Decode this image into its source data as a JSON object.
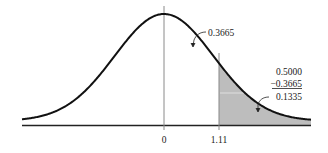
{
  "chart_data": {
    "type": "area",
    "title": "",
    "xlabel": "",
    "ylabel": "",
    "tick_labels": [
      "0",
      "1.11"
    ],
    "x_ticks": [
      0,
      1.11
    ],
    "xlim": [
      -3,
      3
    ],
    "grid": false,
    "legend": null,
    "shaded_region": {
      "from": 1.11,
      "to": "inf"
    },
    "annotations": [
      {
        "text": "0.3665",
        "points_to": "area between 0 and 1.11"
      },
      {
        "lines": [
          "0.5000",
          "−0.3665",
          "0.1335"
        ],
        "points_to": "shaded tail area right of 1.11"
      }
    ],
    "values": {
      "area_0_to_z": 0.3665,
      "half_area": 0.5,
      "tail_area": 0.1335,
      "z": 1.11
    }
  },
  "labels": {
    "zero": "0",
    "z": "1.11",
    "area_center": "0.3665",
    "calc_line1": "0.5000",
    "calc_line2": "−0.3665",
    "calc_line3": "0.1335"
  },
  "colors": {
    "curve": "#111111",
    "axis": "#222222",
    "vline": "#8a8a8a",
    "shade": "#bdbdbd"
  }
}
